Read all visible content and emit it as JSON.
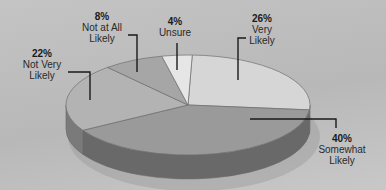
{
  "chart_data": {
    "type": "pie",
    "style": "3d",
    "title": "",
    "categories": [
      "Very Likely",
      "Somewhat Likely",
      "Not Very Likely",
      "Not at All Likely",
      "Unsure"
    ],
    "values": [
      26,
      40,
      22,
      8,
      4
    ],
    "unit": "%",
    "legend": "none (callout labels)",
    "colors": [
      "#d6d6d6",
      "#9a9a9a",
      "#b3b3b3",
      "#a6a6a6",
      "#e6e6e6"
    ]
  },
  "labels": [
    {
      "pct": "26%",
      "line1": "Very",
      "line2": "Likely"
    },
    {
      "pct": "40%",
      "line1": "Somewhat",
      "line2": "Likely"
    },
    {
      "pct": "22%",
      "line1": "Not Very",
      "line2": "Likely"
    },
    {
      "pct": "8%",
      "line1": "Not at All",
      "line2": "Likely"
    },
    {
      "pct": "4%",
      "line1": "Unsure",
      "line2": ""
    }
  ]
}
